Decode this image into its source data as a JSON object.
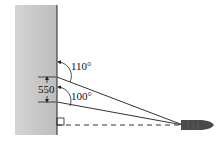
{
  "diagram": {
    "labels": {
      "angle_top": "110°",
      "angle_bottom": "100°",
      "distance": "550"
    },
    "colors": {
      "wall": "#c8c8c8",
      "line": "#333333",
      "boat": "#444444"
    }
  }
}
